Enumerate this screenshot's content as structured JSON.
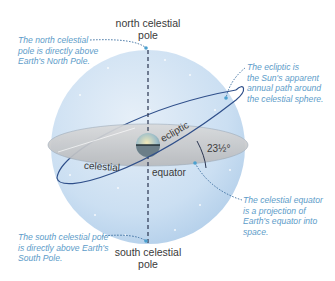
{
  "diagram": {
    "title_labels": {
      "north_pole": [
        "north celestial",
        "pole"
      ],
      "south_pole": [
        "south celestial",
        "pole"
      ],
      "celestial": "celestial",
      "equator": "equator",
      "ecliptic": "ecliptic",
      "tilt_angle": "23½°"
    },
    "notes": {
      "north": [
        "The north celestial",
        "pole is directly above",
        "Earth's North Pole."
      ],
      "ecliptic": [
        "The ecliptic is",
        "the Sun's apparent",
        "annual path around",
        "the celestial sphere."
      ],
      "equator": [
        "The celestial equator",
        "is a projection of",
        "Earth's equator into",
        "space."
      ],
      "south": [
        "The south celestial pole",
        "is directly above Earth's",
        "South Pole."
      ]
    },
    "colors": {
      "sphere": "#cfe0f1",
      "sphere_edge": "#a9c8e6",
      "equator_plane": "#c8c9cb",
      "ecliptic_line": "#2f4f8a",
      "note_text": "#5d9cc9",
      "axis": "#2a3550"
    }
  }
}
